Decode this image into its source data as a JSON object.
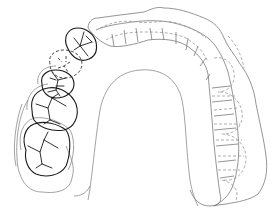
{
  "figure": {
    "type": "dental arch occlusal view line drawing",
    "colors": {
      "background": "#ffffff",
      "tooth_outline": "#1a1a1a",
      "gum_outline": "#8a8a8a",
      "dashed_outline": "#9a9a9a"
    },
    "components": {
      "left_teeth": [
        "molar-2",
        "molar-1",
        "premolar-2",
        "premolar-1-missing-dashed",
        "canine"
      ],
      "appliance": "splint covering anterior and right-side teeth with dashed tooth outlines",
      "palate": "inner palatal arch outline"
    }
  }
}
